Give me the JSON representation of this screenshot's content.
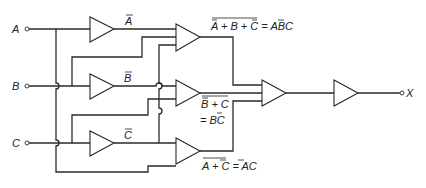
{
  "diagram": {
    "type": "logic-circuit",
    "inputs": [
      {
        "id": "A",
        "label": "A"
      },
      {
        "id": "B",
        "label": "B"
      },
      {
        "id": "C",
        "label": "C"
      }
    ],
    "output": {
      "id": "X",
      "label": "X"
    },
    "inverters": [
      {
        "id": "inv-a",
        "input": "A",
        "label": "A",
        "label_overbar": true
      },
      {
        "id": "inv-b",
        "input": "B",
        "label": "B",
        "label_overbar": true
      },
      {
        "id": "inv-c",
        "input": "C",
        "label": "C",
        "label_overbar": true
      }
    ],
    "nor_gates": [
      {
        "id": "g1",
        "inputs": [
          "Ā",
          "B",
          "C̄"
        ],
        "expr_lhs": "A + B + C",
        "expr_rhs": "= ABC"
      },
      {
        "id": "g2",
        "inputs": [
          "B̄",
          "C"
        ],
        "expr_lhs": "B + C",
        "expr_rhs": "= BC"
      },
      {
        "id": "g3",
        "inputs": [
          "A",
          "C̄"
        ],
        "expr_lhs": "A + C",
        "expr_rhs": "= AC"
      }
    ],
    "final_gates": [
      {
        "id": "g4",
        "inputs": [
          "g1",
          "g2",
          "g3"
        ]
      },
      {
        "id": "g5",
        "inputs": [
          "g4"
        ],
        "output": "X"
      }
    ],
    "labels": {
      "A": "A",
      "B": "B",
      "C": "C",
      "X": "X",
      "abar": "A",
      "bbar": "B",
      "cbar": "C",
      "g1_expr": "A + B + C = ABC",
      "g2_expr_line1": "B + C",
      "g2_expr_line2": "= BC",
      "g3_expr": "A + C = AC"
    }
  }
}
